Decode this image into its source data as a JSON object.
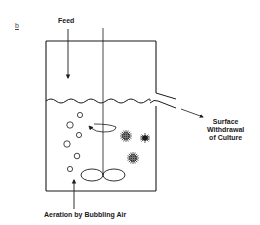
{
  "figure": {
    "panel_label": "b",
    "labels": {
      "feed": "Feed",
      "withdrawal_line1": "Surface",
      "withdrawal_line2": "Withdrawal",
      "withdrawal_line3": "of Culture",
      "aeration": "Aeration by Bubbling Air"
    },
    "components": [
      "vessel",
      "feed-inlet",
      "liquid-surface",
      "stirrer-shaft",
      "impeller",
      "rotation-arrow",
      "air-bubbles",
      "microorganisms",
      "surface-outlet",
      "aeration-inlet"
    ],
    "colors": {
      "line": "#1a1a1a",
      "cell_fill": "#555555",
      "background": "#ffffff"
    }
  }
}
